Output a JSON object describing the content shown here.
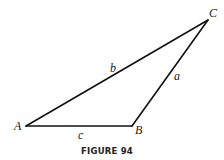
{
  "figure": {
    "caption": "FIGURE 94",
    "vertices": [
      {
        "id": "A",
        "label": "A",
        "x": 26,
        "y": 126,
        "label_x": 14,
        "label_y": 130
      },
      {
        "id": "B",
        "label": "B",
        "x": 132,
        "y": 126,
        "label_x": 135,
        "label_y": 134
      },
      {
        "id": "C",
        "label": "C",
        "x": 208,
        "y": 20,
        "label_x": 209,
        "label_y": 17
      }
    ],
    "sides": [
      {
        "id": "a",
        "label": "a",
        "from": "B",
        "to": "C",
        "label_x": 174,
        "label_y": 80
      },
      {
        "id": "b",
        "label": "b",
        "from": "A",
        "to": "C",
        "label_x": 110,
        "label_y": 72
      },
      {
        "id": "c",
        "label": "c",
        "from": "A",
        "to": "B",
        "label_x": 78,
        "label_y": 139
      }
    ],
    "stroke_color": "#111111"
  }
}
